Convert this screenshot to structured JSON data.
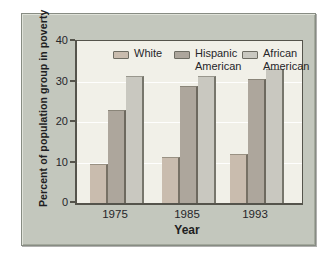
{
  "figure": {
    "frame_background": "#c3c7bd",
    "plot_background": "#f1f0e8",
    "axis_color": "#55544c",
    "text_color": "#26262a"
  },
  "chart_data": {
    "type": "bar",
    "title": "",
    "xlabel": "Year",
    "ylabel": "Percent of population group in poverty",
    "categories": [
      "1975",
      "1985",
      "1993"
    ],
    "series": [
      {
        "name": "White",
        "color": "#c9bcae",
        "values": [
          9.7,
          11.4,
          12.2
        ]
      },
      {
        "name": "Hispanic American",
        "color": "#ada69c",
        "values": [
          23.0,
          29.0,
          30.6
        ]
      },
      {
        "name": "African American",
        "color": "#c9c8c0",
        "values": [
          31.3,
          31.3,
          33.1
        ]
      }
    ],
    "ylim": [
      0,
      40
    ],
    "yticks": [
      0,
      10,
      20,
      30,
      40
    ],
    "grid": "horizontal-white",
    "legend_position": "top-inside"
  }
}
